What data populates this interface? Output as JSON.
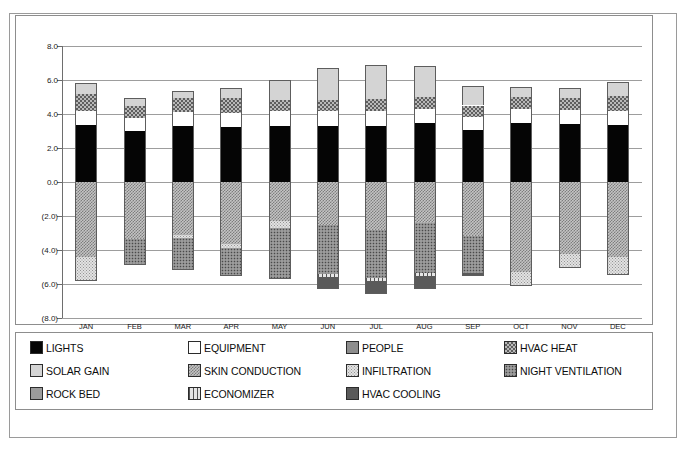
{
  "chart_data": {
    "type": "bar",
    "subtype": "stacked-bar-diverging",
    "title": "",
    "xlabel": "",
    "ylabel": "",
    "ylim": [
      -8.0,
      8.0
    ],
    "ytick_values": [
      8.0,
      6.0,
      4.0,
      2.0,
      0.0,
      -2.0,
      -4.0,
      -6.0,
      -8.0
    ],
    "ytick_labels": [
      "8.0",
      "6.0",
      "4.0",
      "2.0",
      "0.0",
      "(2.0)",
      "(4.0)",
      "(6.0)",
      "(8.0)"
    ],
    "grid": true,
    "legend_position": "bottom",
    "categories": [
      "JAN",
      "FEB",
      "MAR",
      "APR",
      "MAY",
      "JUN",
      "JUL",
      "AUG",
      "SEP",
      "OCT",
      "NOV",
      "DEC"
    ],
    "series": [
      {
        "name": "LIGHTS",
        "pattern": "solid-black",
        "color": "#050505",
        "values": [
          3.35,
          3.0,
          3.3,
          3.25,
          3.3,
          3.3,
          3.3,
          3.45,
          3.05,
          3.45,
          3.4,
          3.35
        ]
      },
      {
        "name": "EQUIPMENT",
        "pattern": "solid-white",
        "color": "#ffffff",
        "values": [
          0.85,
          0.75,
          0.8,
          0.8,
          0.85,
          0.85,
          0.85,
          0.85,
          0.8,
          0.85,
          0.85,
          0.85
        ]
      },
      {
        "name": "PEOPLE",
        "pattern": "solid-gray",
        "color": "#8d8d8d",
        "values": [
          0.0,
          0.0,
          0.0,
          0.0,
          0.0,
          0.0,
          0.0,
          0.0,
          0.0,
          0.0,
          0.0,
          0.0
        ]
      },
      {
        "name": "HVAC HEAT",
        "pattern": "crosshatch",
        "color": "#b9b9b9",
        "values": [
          0.95,
          0.7,
          0.85,
          0.9,
          0.7,
          0.7,
          0.75,
          0.7,
          0.65,
          0.7,
          0.7,
          0.85
        ]
      },
      {
        "name": "SOLAR GAIN",
        "pattern": "light-gray",
        "color": "#d4d4d4",
        "values": [
          0.7,
          0.5,
          0.4,
          0.6,
          1.15,
          1.85,
          2.0,
          1.85,
          1.15,
          0.6,
          0.6,
          0.85
        ]
      },
      {
        "name": "SKIN CONDUCTION",
        "pattern": "fine-crosshatch",
        "color": "#c4c4c4",
        "values": [
          -4.4,
          -3.35,
          -3.1,
          -3.65,
          -2.3,
          -2.55,
          -2.85,
          -2.4,
          -3.2,
          -5.3,
          -4.25,
          -4.4
        ]
      },
      {
        "name": "INFILTRATION",
        "pattern": "dotted-light",
        "color": "#e2e2e2",
        "values": [
          -1.45,
          0.0,
          -0.2,
          -0.25,
          -0.4,
          0.0,
          0.0,
          0.0,
          0.0,
          -0.8,
          -0.75,
          -1.1
        ]
      },
      {
        "name": "NIGHT VENTILATION",
        "pattern": "speckled",
        "color": "#8a8a8a",
        "values": [
          0.0,
          -1.45,
          -1.8,
          -1.55,
          -3.0,
          -2.85,
          -2.8,
          -2.95,
          -2.15,
          0.0,
          0.0,
          0.0
        ]
      },
      {
        "name": "ROCK BED",
        "pattern": "mid-gray",
        "color": "#9c9c9c",
        "values": [
          0.0,
          0.0,
          0.0,
          0.0,
          0.0,
          0.0,
          0.0,
          0.0,
          0.0,
          0.0,
          0.0,
          0.0
        ]
      },
      {
        "name": "ECONOMIZER",
        "pattern": "vertical-lines",
        "color": "#e6e6e6",
        "values": [
          0.0,
          0.0,
          0.0,
          0.0,
          0.0,
          -0.2,
          -0.2,
          -0.2,
          0.0,
          0.0,
          0.0,
          0.0
        ]
      },
      {
        "name": "HVAC COOLING",
        "pattern": "dark-gray",
        "color": "#5a5a5a",
        "values": [
          0.0,
          -0.05,
          -0.05,
          -0.05,
          0.0,
          -0.7,
          -0.75,
          -0.75,
          -0.2,
          0.0,
          -0.05,
          0.0
        ]
      }
    ],
    "positive_totals": [
      5.85,
      4.95,
      5.35,
      5.55,
      6.0,
      6.7,
      6.9,
      6.85,
      5.65,
      5.6,
      5.55,
      5.9
    ],
    "negative_totals": [
      -5.85,
      -4.85,
      -5.15,
      -5.5,
      -5.7,
      -6.3,
      -6.6,
      -6.3,
      -5.55,
      -6.1,
      -5.05,
      -5.5
    ]
  },
  "legend": {
    "items": [
      {
        "label": "LIGHTS",
        "swatch": "f-lights"
      },
      {
        "label": "EQUIPMENT",
        "swatch": "f-equipment"
      },
      {
        "label": "PEOPLE",
        "swatch": "f-people"
      },
      {
        "label": "HVAC HEAT",
        "swatch": "f-hvac-heat"
      },
      {
        "label": "SOLAR GAIN",
        "swatch": "f-solar-gain"
      },
      {
        "label": "SKIN CONDUCTION",
        "swatch": "f-skin-conduction"
      },
      {
        "label": "INFILTRATION",
        "swatch": "f-infiltration"
      },
      {
        "label": "NIGHT VENTILATION",
        "swatch": "f-night-ventilation"
      },
      {
        "label": "ROCK BED",
        "swatch": "f-rock-bed"
      },
      {
        "label": "ECONOMIZER",
        "swatch": "f-economizer"
      },
      {
        "label": "HVAC COOLING",
        "swatch": "f-hvac-cooling"
      }
    ]
  }
}
